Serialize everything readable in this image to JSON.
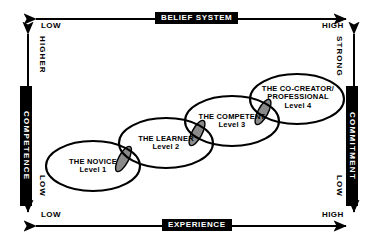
{
  "diagram": {
    "axes": {
      "top": {
        "name": "belief-system",
        "label": "BELIEF SYSTEM",
        "left_end": "LOW",
        "right_end": "HIGH"
      },
      "bottom": {
        "name": "experience",
        "label": "EXPERIENCE",
        "left_end": "LOW",
        "right_end": "HIGH"
      },
      "left": {
        "name": "competence",
        "label": "COMPETENCE",
        "top_end": "HIGHER",
        "bottom_end": "LOW"
      },
      "right": {
        "name": "commitment",
        "label": "COMMITMENT",
        "top_end": "STRONG",
        "bottom_end": "LOW"
      }
    },
    "stages": [
      {
        "name": "THE NOVICE",
        "level": "Level 1"
      },
      {
        "name": "THE LEARNER",
        "level": "Level 2"
      },
      {
        "name": "THE COMPETENT",
        "level": "Level 3"
      },
      {
        "name": "THE CO-CREATOR/",
        "name2": "PROFESSIONAL",
        "level": "Level 4"
      }
    ],
    "colors": {
      "ink": "#000000",
      "background": "#ffffff",
      "chip_fill": "#000000",
      "chip_text": "#ffffff",
      "overlap_fill": "#8a8a8a",
      "ellipse_fill": "#ffffff"
    }
  }
}
